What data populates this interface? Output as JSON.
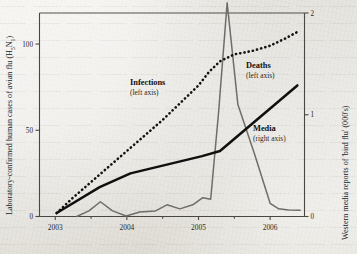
{
  "chart_data": {
    "type": "line",
    "title": "",
    "subtitle": "",
    "xlabel": "",
    "ylabel": "Laboratory-confirmed human cases of avian flu (H5N1)",
    "y2label": "Western media reports of 'bird flu' (000's)",
    "grid": false,
    "legend_position": "inline-annotations",
    "x_tick_labels": [
      "2003",
      "2004",
      "2005",
      "2006"
    ],
    "x_tick_values": [
      2003,
      2004,
      2005,
      2006
    ],
    "xlim": [
      2002.78,
      2006.48
    ],
    "y_tick_labels": [
      "0",
      "50",
      "100"
    ],
    "y_tick_values": [
      0,
      50,
      100
    ],
    "ylim": [
      0,
      118
    ],
    "y2_tick_labels": [
      "0",
      "1",
      "2"
    ],
    "y2_tick_values": [
      0,
      1,
      2
    ],
    "y2lim": [
      0,
      2
    ],
    "series": [
      {
        "name": "Infections",
        "axis": "left",
        "style": "dotted",
        "annotation": "Infections",
        "annotation_sub": "(left axis)",
        "x": [
          2003.02,
          2003.25,
          2003.5,
          2003.75,
          2004.0,
          2004.25,
          2004.5,
          2004.75,
          2005.0,
          2005.15,
          2005.3,
          2005.5,
          2005.75,
          2006.0,
          2006.2,
          2006.38
        ],
        "y": [
          2,
          11,
          20,
          29,
          38,
          47,
          56,
          66,
          76,
          84,
          90,
          94,
          96,
          99,
          103,
          107
        ]
      },
      {
        "name": "Deaths",
        "axis": "left",
        "style": "solid-thick",
        "annotation": "Deaths",
        "annotation_sub": "(left axis)",
        "x": [
          2003.02,
          2003.62,
          2004.05,
          2005.05,
          2005.3,
          2006.38
        ],
        "y": [
          2,
          17,
          25,
          35,
          38,
          76
        ]
      },
      {
        "name": "Media",
        "axis": "right",
        "style": "solid-thin",
        "annotation": "Media",
        "annotation_sub": "(right axis)",
        "x": [
          2003.3,
          2003.47,
          2003.63,
          2003.8,
          2003.99,
          2004.18,
          2004.4,
          2004.56,
          2004.74,
          2004.92,
          2005.06,
          2005.17,
          2005.28,
          2005.4,
          2005.55,
          2005.78,
          2006.0,
          2006.12,
          2006.26,
          2006.42
        ],
        "y": [
          0.0,
          0.055,
          0.145,
          0.055,
          0.005,
          0.045,
          0.055,
          0.115,
          0.075,
          0.115,
          0.185,
          0.17,
          1.02,
          2.1,
          1.1,
          0.62,
          0.13,
          0.075,
          0.065,
          0.062
        ]
      }
    ]
  },
  "axes": {
    "left_title": "Laboratory-confirmed human cases of avian flu (H",
    "left_title_sub1": "5",
    "left_title_mid": "N",
    "left_title_sub2": "1",
    "left_title_end": ")",
    "right_title": "Western media reports of 'bird flu' (000's)"
  },
  "annotations": [
    {
      "label": "Infections",
      "sub": "(left axis)"
    },
    {
      "label": "Deaths",
      "sub": "(left axis)"
    },
    {
      "label": "Media",
      "sub": "(right axis)"
    }
  ],
  "colors": {
    "paper": "#e9e7e1",
    "ink": "#1d1b18",
    "infections": "#151311",
    "deaths": "#101010",
    "media": "#6f6d69",
    "axis": "#4a4742"
  }
}
